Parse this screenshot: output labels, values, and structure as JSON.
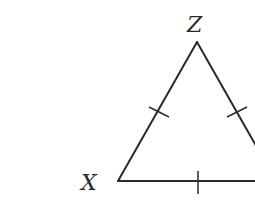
{
  "diagram": {
    "type": "isosceles/equilateral triangle",
    "vertices": {
      "Z": {
        "label": "Z"
      },
      "X": {
        "label": "X"
      }
    },
    "tick_marks": {
      "side_XZ": 1,
      "side_ZY": 1,
      "side_XY": 1
    },
    "stroke_color": "#2a2a2a",
    "background_color": "#ffffff"
  }
}
